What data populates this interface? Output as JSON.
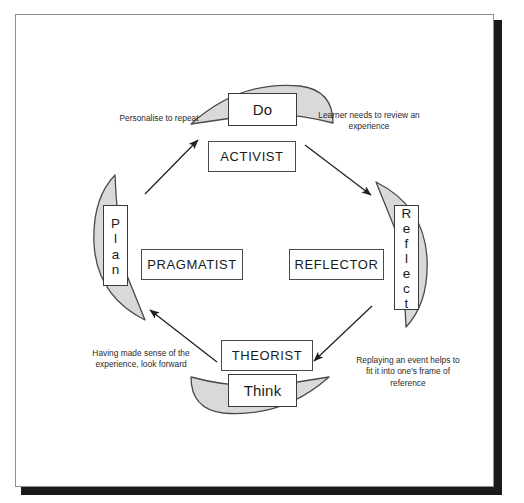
{
  "diagram": {
    "colors": {
      "arc_fill": "#d9d9d9",
      "arc_stroke": "#4a4a4a",
      "box_stroke": "#3a3a3a",
      "text": "#1a1a1a",
      "frame_border": "#8f8f8f",
      "frame_shadow": "#1a1a1a"
    },
    "stages": [
      {
        "id": "do",
        "label": "Do",
        "orientation": "horizontal",
        "position": "top"
      },
      {
        "id": "reflect",
        "label": "Reflect",
        "orientation": "vertical",
        "position": "right"
      },
      {
        "id": "think",
        "label": "Think",
        "orientation": "horizontal",
        "position": "bottom"
      },
      {
        "id": "plan",
        "label": "Plan",
        "orientation": "vertical",
        "position": "left"
      }
    ],
    "styles": [
      {
        "id": "activist",
        "label": "ACTIVIST",
        "position": "top"
      },
      {
        "id": "reflector",
        "label": "REFLECTOR",
        "position": "right"
      },
      {
        "id": "theorist",
        "label": "THEORIST",
        "position": "bottom"
      },
      {
        "id": "pragmatist",
        "label": "PRAGMATIST",
        "position": "left"
      }
    ],
    "notes": [
      {
        "id": "note-do-to-reflect",
        "text": "Learner needs to review an experience",
        "position": "top-right"
      },
      {
        "id": "note-reflect-to-think",
        "text": "Replaying an event helps to fit it into one's frame of reference",
        "position": "bottom-right"
      },
      {
        "id": "note-think-to-plan",
        "text": "Having made sense of the experience, look forward",
        "position": "bottom-left"
      },
      {
        "id": "note-plan-to-do",
        "text": "Personalise to repeat",
        "position": "top-left"
      }
    ],
    "arrows": [
      {
        "id": "arrow-do-to-reflect",
        "from": "do",
        "to": "reflect",
        "direction": "down-right"
      },
      {
        "id": "arrow-reflect-to-think",
        "from": "reflect",
        "to": "think",
        "direction": "down-left"
      },
      {
        "id": "arrow-think-to-plan",
        "from": "think",
        "to": "plan",
        "direction": "up-left"
      },
      {
        "id": "arrow-plan-to-do",
        "from": "plan",
        "to": "do",
        "direction": "up-right"
      }
    ]
  },
  "stage_letters": {
    "reflect": [
      "R",
      "e",
      "f",
      "l",
      "e",
      "c",
      "t"
    ],
    "plan": [
      "P",
      "l",
      "a",
      "n"
    ]
  }
}
